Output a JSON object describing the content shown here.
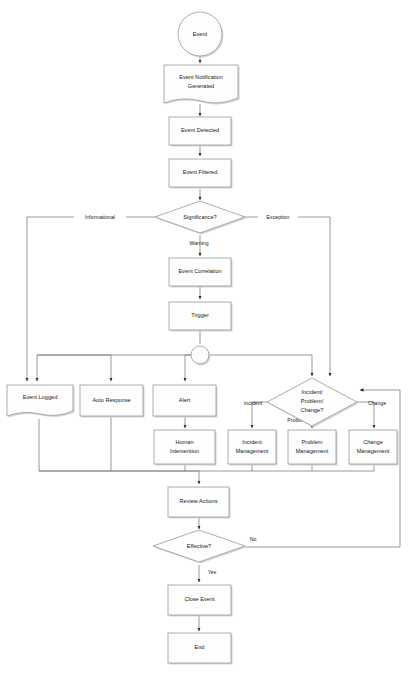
{
  "diagram": {
    "type": "flowchart",
    "nodes": [
      {
        "id": "event",
        "label": "Event",
        "shape": "circle"
      },
      {
        "id": "notification",
        "label_line1": "Event Notification",
        "label_line2": "Generated",
        "shape": "document"
      },
      {
        "id": "detected",
        "label": "Event Detected",
        "shape": "process"
      },
      {
        "id": "filtered",
        "label": "Event Filtered",
        "shape": "process"
      },
      {
        "id": "significance",
        "label": "Significance?",
        "shape": "decision"
      },
      {
        "id": "correlation",
        "label": "Event Correlation",
        "shape": "process"
      },
      {
        "id": "trigger",
        "label": "Trigger",
        "shape": "process"
      },
      {
        "id": "junction",
        "label": "",
        "shape": "connector"
      },
      {
        "id": "logged",
        "label": "Event Logged",
        "shape": "document"
      },
      {
        "id": "autoresponse",
        "label": "Auto Response",
        "shape": "process"
      },
      {
        "id": "alert",
        "label": "Alert",
        "shape": "process"
      },
      {
        "id": "ipc",
        "label_line1": "Incident/",
        "label_line2": "Problem/",
        "label_line3": "Change?",
        "shape": "decision"
      },
      {
        "id": "human",
        "label_line1": "Human",
        "label_line2": "Intervention",
        "shape": "process"
      },
      {
        "id": "incidentmgmt",
        "label_line1": "Incident",
        "label_line2": "Management",
        "shape": "process"
      },
      {
        "id": "problemmgmt",
        "label_line1": "Problem",
        "label_line2": "Management",
        "shape": "process"
      },
      {
        "id": "changemgmt",
        "label_line1": "Change",
        "label_line2": "Management",
        "shape": "process"
      },
      {
        "id": "review",
        "label": "Review Actions",
        "shape": "process"
      },
      {
        "id": "effective",
        "label": "Effective?",
        "shape": "decision"
      },
      {
        "id": "close",
        "label": "Close Event",
        "shape": "process"
      },
      {
        "id": "end",
        "label": "End",
        "shape": "process"
      }
    ],
    "edge_labels": {
      "informational": "Informational",
      "exception": "Exception",
      "warning": "Warning",
      "incident": "Incident",
      "problem": "Problem",
      "change": "Change",
      "no": "No",
      "yes": "Yes"
    },
    "colors": {
      "shape_fill": "#fdfdfd",
      "shape_stroke": "#8a8a8a",
      "shadow": "#cfcfcf",
      "connector": "#6e6e6e",
      "text": "#1a1a1a",
      "background": "#ffffff"
    }
  }
}
